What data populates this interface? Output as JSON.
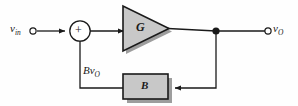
{
  "diagram": {
    "background_color": "#fefefe",
    "line_color": "#1a1a1a",
    "block_fill_color": "#c8c8c8",
    "shadow_color": "#9a9a9a",
    "input": {
      "terminal_label_main": "v",
      "terminal_label_sub": "in",
      "terminal_type": "open-circle"
    },
    "summing_junction": {
      "sign": "+",
      "shape": "circle"
    },
    "forward_block": {
      "label": "G",
      "shape": "triangle-amplifier"
    },
    "feedback_block": {
      "label": "B",
      "shape": "rectangle"
    },
    "feedback_signal": {
      "label_main": "Bv",
      "label_sub": "O"
    },
    "output": {
      "terminal_label_main": "v",
      "terminal_label_sub": "O",
      "terminal_type": "open-circle",
      "node_type": "filled-dot"
    }
  }
}
